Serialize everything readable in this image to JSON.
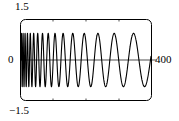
{
  "chart_data": {
    "type": "line",
    "title": "",
    "xlabel": "",
    "ylabel": "",
    "xlim": [
      0,
      400
    ],
    "ylim": [
      -1.5,
      1.5
    ],
    "grid": false,
    "legend": null,
    "y_axis": {
      "max_label": "1.5",
      "zero_label": "0",
      "min_label": "−1.5",
      "tick_values": [
        1.5,
        0,
        -1.5
      ]
    },
    "x_axis": {
      "max_label": "400",
      "tick_values": [
        0,
        400
      ]
    },
    "series": [
      {
        "name": "chirp",
        "amplitude": 1.0,
        "x": [
          0,
          2,
          4,
          6,
          8,
          10,
          12,
          14,
          16,
          18,
          20,
          24,
          28,
          32,
          36,
          40,
          45,
          50,
          55,
          60,
          65,
          70,
          75,
          80,
          85,
          90,
          95,
          100,
          110,
          120,
          130,
          140,
          150,
          160,
          170,
          180,
          190,
          200,
          210,
          220,
          230,
          240,
          250,
          260,
          270,
          280,
          290,
          300,
          310,
          320,
          330,
          340,
          350,
          360,
          370,
          380,
          390,
          400
        ],
        "y": [
          0.0,
          0.85,
          1.0,
          0.5,
          -0.35,
          -0.95,
          -0.85,
          -0.2,
          0.6,
          1.0,
          0.75,
          -0.45,
          -1.0,
          -0.35,
          0.8,
          0.95,
          -0.1,
          -0.95,
          -0.6,
          0.55,
          1.0,
          0.35,
          -0.8,
          -0.95,
          0.0,
          0.9,
          0.85,
          0.05,
          -0.95,
          -0.5,
          0.7,
          1.0,
          0.4,
          -0.6,
          -1.0,
          -0.55,
          0.4,
          0.95,
          0.8,
          0.0,
          -0.85,
          -0.95,
          -0.25,
          0.7,
          1.0,
          0.5,
          -0.45,
          -0.95,
          -0.75,
          0.15,
          0.9,
          0.9,
          0.15,
          -0.75,
          -1.0,
          -0.5,
          0.4,
          0.9
        ],
        "color": "#000000",
        "line_width": 1.1
      }
    ],
    "zero_line": {
      "value": 0,
      "color": "#000000",
      "line_width": 0.7
    },
    "frame": {
      "color": "#000000",
      "line_width": 1.0,
      "rounded": true,
      "corner_radius": 5
    },
    "colors": {
      "background": "#ffffff",
      "foreground": "#000000"
    }
  }
}
